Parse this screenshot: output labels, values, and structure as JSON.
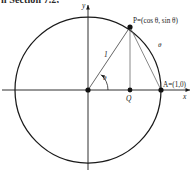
{
  "page": {
    "cut_header_text": "n Section 7.2,",
    "width": 196,
    "height": 172,
    "background": "#ffffff",
    "stroke_color": "#1a1a1a"
  },
  "figure": {
    "axes": {
      "x_label": "x",
      "y_label": "y",
      "origin_px": {
        "x": 88,
        "y": 90
      }
    },
    "circle": {
      "center_px": {
        "x": 88,
        "y": 90
      },
      "radius_px": 73,
      "radius_value": "1"
    },
    "points": [
      {
        "name": "origin",
        "label": "",
        "px": {
          "x": 88,
          "y": 90
        }
      },
      {
        "name": "P",
        "label": "P=(cos θ, sin θ)",
        "px": {
          "x": 130,
          "y": 27
        }
      },
      {
        "name": "Q",
        "label": "Q",
        "px": {
          "x": 130,
          "y": 90
        }
      },
      {
        "name": "A",
        "label": "A=(1,0)",
        "px": {
          "x": 161,
          "y": 90
        }
      }
    ],
    "segments": [
      {
        "name": "radius-OP",
        "label": "1",
        "from": "origin",
        "to": "P"
      },
      {
        "name": "perpendicular-PQ",
        "label": "",
        "from": "P",
        "to": "Q"
      },
      {
        "name": "chord-PA",
        "label": "",
        "from": "P",
        "to": "A"
      }
    ],
    "angles": [
      {
        "name": "angle-at-origin",
        "label": "θ"
      },
      {
        "name": "arc-angle-label",
        "label": "θ"
      }
    ]
  }
}
